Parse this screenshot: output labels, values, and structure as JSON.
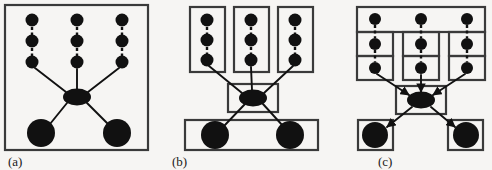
{
  "figure": {
    "background_color": "#f6f5f3",
    "ink_color": "#111111",
    "box_stroke_color": "#3a3a3a",
    "width": 492,
    "height": 170,
    "panel_count": 3
  },
  "panels": [
    {
      "id": "panel-a",
      "caption": "(a)",
      "caption_x": 8,
      "caption_y": 166,
      "description": "single enclosing box around the whole graph",
      "outer_boxes": [
        {
          "name": "panel-a-outer-box",
          "x": 5,
          "y": 5,
          "w": 143,
          "h": 145
        }
      ],
      "inner_boxes": [],
      "small_nodes": [
        {
          "name": "node-col1-row1",
          "cx": 32,
          "cy": 20,
          "r": 6.5
        },
        {
          "name": "node-col1-row2",
          "cx": 32,
          "cy": 41,
          "r": 6.5
        },
        {
          "name": "node-col1-row3",
          "cx": 32,
          "cy": 62,
          "r": 6.5
        },
        {
          "name": "node-col2-row1",
          "cx": 77,
          "cy": 20,
          "r": 6.5
        },
        {
          "name": "node-col2-row2",
          "cx": 77,
          "cy": 41,
          "r": 6.5
        },
        {
          "name": "node-col2-row3",
          "cx": 77,
          "cy": 62,
          "r": 6.5
        },
        {
          "name": "node-col3-row1",
          "cx": 122,
          "cy": 20,
          "r": 6.5
        },
        {
          "name": "node-col3-row2",
          "cx": 122,
          "cy": 41,
          "r": 6.5
        },
        {
          "name": "node-col3-row3",
          "cx": 122,
          "cy": 62,
          "r": 6.5
        }
      ],
      "hub_node": {
        "name": "hub-ellipse",
        "cx": 77,
        "cy": 97,
        "rx": 14,
        "ry": 8.5
      },
      "large_nodes": [
        {
          "name": "large-node-left",
          "cx": 41,
          "cy": 133,
          "r": 14
        },
        {
          "name": "large-node-right",
          "cx": 117,
          "cy": 133,
          "r": 14
        }
      ],
      "dashed_edges": [
        {
          "name": "dashed-edge-col1-12",
          "x1": 32,
          "y1": 27,
          "x2": 32,
          "y2": 35
        },
        {
          "name": "dashed-edge-col1-23",
          "x1": 32,
          "y1": 48,
          "x2": 32,
          "y2": 56
        },
        {
          "name": "dashed-edge-col2-12",
          "x1": 77,
          "y1": 27,
          "x2": 77,
          "y2": 35
        },
        {
          "name": "dashed-edge-col2-23",
          "x1": 77,
          "y1": 48,
          "x2": 77,
          "y2": 56
        },
        {
          "name": "dashed-edge-col3-12",
          "x1": 122,
          "y1": 27,
          "x2": 122,
          "y2": 35
        },
        {
          "name": "dashed-edge-col3-23",
          "x1": 122,
          "y1": 48,
          "x2": 122,
          "y2": 56
        }
      ],
      "solid_edges": [
        {
          "name": "edge-col1-to-hub",
          "x1": 35,
          "y1": 68,
          "x2": 66,
          "y2": 92
        },
        {
          "name": "edge-col2-to-hub",
          "x1": 77,
          "y1": 69,
          "x2": 77,
          "y2": 89
        },
        {
          "name": "edge-col3-to-hub",
          "x1": 119,
          "y1": 68,
          "x2": 88,
          "y2": 92
        },
        {
          "name": "edge-hub-to-left",
          "x1": 67,
          "y1": 103,
          "x2": 50,
          "y2": 124
        },
        {
          "name": "edge-hub-to-right",
          "x1": 87,
          "y1": 103,
          "x2": 108,
          "y2": 124
        }
      ],
      "arrowheads": false
    },
    {
      "id": "panel-b",
      "caption": "(b)",
      "caption_x": 172,
      "caption_y": 166,
      "description": "flat partition: one box per column, one box for hub, one box for both large nodes",
      "outer_boxes": [],
      "inner_boxes": [
        {
          "name": "cluster-box-col1",
          "x": 190,
          "y": 7,
          "w": 35,
          "h": 65
        },
        {
          "name": "cluster-box-col2",
          "x": 234,
          "y": 7,
          "w": 35,
          "h": 65
        },
        {
          "name": "cluster-box-col3",
          "x": 278,
          "y": 7,
          "w": 35,
          "h": 65
        },
        {
          "name": "cluster-box-hub",
          "x": 228,
          "y": 84,
          "w": 50,
          "h": 28
        },
        {
          "name": "cluster-box-sinks",
          "x": 185,
          "y": 120,
          "w": 133,
          "h": 30
        }
      ],
      "small_nodes": [
        {
          "name": "node-col1-row1",
          "cx": 207,
          "cy": 20,
          "r": 6.5
        },
        {
          "name": "node-col1-row2",
          "cx": 207,
          "cy": 40,
          "r": 6.5
        },
        {
          "name": "node-col1-row3",
          "cx": 207,
          "cy": 60,
          "r": 6.5
        },
        {
          "name": "node-col2-row1",
          "cx": 251,
          "cy": 20,
          "r": 6.5
        },
        {
          "name": "node-col2-row2",
          "cx": 251,
          "cy": 40,
          "r": 6.5
        },
        {
          "name": "node-col2-row3",
          "cx": 251,
          "cy": 60,
          "r": 6.5
        },
        {
          "name": "node-col3-row1",
          "cx": 295,
          "cy": 20,
          "r": 6.5
        },
        {
          "name": "node-col3-row2",
          "cx": 295,
          "cy": 40,
          "r": 6.5
        },
        {
          "name": "node-col3-row3",
          "cx": 295,
          "cy": 60,
          "r": 6.5
        }
      ],
      "hub_node": {
        "name": "hub-ellipse",
        "cx": 253,
        "cy": 98,
        "rx": 14,
        "ry": 8.5
      },
      "large_nodes": [
        {
          "name": "large-node-left",
          "cx": 215,
          "cy": 135,
          "r": 14
        },
        {
          "name": "large-node-right",
          "cx": 290,
          "cy": 135,
          "r": 14
        }
      ],
      "dashed_edges": [
        {
          "name": "dashed-edge-col1-12",
          "x1": 207,
          "y1": 27,
          "x2": 207,
          "y2": 34
        },
        {
          "name": "dashed-edge-col1-23",
          "x1": 207,
          "y1": 47,
          "x2": 207,
          "y2": 54
        },
        {
          "name": "dashed-edge-col2-12",
          "x1": 251,
          "y1": 27,
          "x2": 251,
          "y2": 34
        },
        {
          "name": "dashed-edge-col2-23",
          "x1": 251,
          "y1": 47,
          "x2": 251,
          "y2": 54
        },
        {
          "name": "dashed-edge-col3-12",
          "x1": 295,
          "y1": 27,
          "x2": 295,
          "y2": 34
        },
        {
          "name": "dashed-edge-col3-23",
          "x1": 295,
          "y1": 47,
          "x2": 295,
          "y2": 54
        }
      ],
      "solid_edges": [
        {
          "name": "edge-col1-to-hub",
          "x1": 209,
          "y1": 66,
          "x2": 242,
          "y2": 93
        },
        {
          "name": "edge-col2-to-hub",
          "x1": 251,
          "y1": 67,
          "x2": 252,
          "y2": 90
        },
        {
          "name": "edge-col3-to-hub",
          "x1": 293,
          "y1": 66,
          "x2": 264,
          "y2": 93
        },
        {
          "name": "edge-hub-to-left",
          "x1": 245,
          "y1": 104,
          "x2": 224,
          "y2": 126
        },
        {
          "name": "edge-hub-to-right",
          "x1": 263,
          "y1": 104,
          "x2": 283,
          "y2": 126
        }
      ],
      "arrowheads": false
    },
    {
      "id": "panel-c",
      "caption": "(c)",
      "caption_x": 378,
      "caption_y": 166,
      "description": "finer partition: top row shares one wide box, rows 2 and 3 boxed per column, hub boxed, each large node in its own box; edges carry arrowheads",
      "outer_boxes": [],
      "inner_boxes": [
        {
          "name": "cluster-box-top-row",
          "x": 357,
          "y": 7,
          "w": 128,
          "h": 25
        },
        {
          "name": "cluster-box-col1-row2",
          "x": 357,
          "y": 32,
          "w": 36,
          "h": 24
        },
        {
          "name": "cluster-box-col1-row3",
          "x": 357,
          "y": 56,
          "w": 36,
          "h": 24
        },
        {
          "name": "cluster-box-col2-row2",
          "x": 403,
          "y": 32,
          "w": 36,
          "h": 24
        },
        {
          "name": "cluster-box-col2-row3",
          "x": 403,
          "y": 56,
          "w": 36,
          "h": 24
        },
        {
          "name": "cluster-box-col3-row2",
          "x": 449,
          "y": 32,
          "w": 36,
          "h": 24
        },
        {
          "name": "cluster-box-col3-row3",
          "x": 449,
          "y": 56,
          "w": 36,
          "h": 24
        },
        {
          "name": "cluster-box-hub",
          "x": 396,
          "y": 86,
          "w": 50,
          "h": 28
        },
        {
          "name": "cluster-box-sink-left",
          "x": 358,
          "y": 120,
          "w": 35,
          "h": 30
        },
        {
          "name": "cluster-box-sink-right",
          "x": 448,
          "y": 120,
          "w": 35,
          "h": 30
        }
      ],
      "small_nodes": [
        {
          "name": "node-col1-row1",
          "cx": 375,
          "cy": 19,
          "r": 6
        },
        {
          "name": "node-col1-row2",
          "cx": 375,
          "cy": 44,
          "r": 6
        },
        {
          "name": "node-col1-row3",
          "cx": 375,
          "cy": 68,
          "r": 6
        },
        {
          "name": "node-col2-row1",
          "cx": 421,
          "cy": 19,
          "r": 6
        },
        {
          "name": "node-col2-row2",
          "cx": 421,
          "cy": 44,
          "r": 6
        },
        {
          "name": "node-col2-row3",
          "cx": 421,
          "cy": 68,
          "r": 6
        },
        {
          "name": "node-col3-row1",
          "cx": 467,
          "cy": 19,
          "r": 6
        },
        {
          "name": "node-col3-row2",
          "cx": 467,
          "cy": 44,
          "r": 6
        },
        {
          "name": "node-col3-row3",
          "cx": 467,
          "cy": 68,
          "r": 6
        }
      ],
      "hub_node": {
        "name": "hub-ellipse",
        "cx": 421,
        "cy": 100,
        "rx": 14,
        "ry": 8.5
      },
      "large_nodes": [
        {
          "name": "large-node-left",
          "cx": 375,
          "cy": 135,
          "r": 13
        },
        {
          "name": "large-node-right",
          "cx": 466,
          "cy": 135,
          "r": 13
        }
      ],
      "dashed_edges": [
        {
          "name": "dashed-edge-col1-12",
          "x1": 375,
          "y1": 25,
          "x2": 375,
          "y2": 38
        },
        {
          "name": "dashed-edge-col1-23",
          "x1": 375,
          "y1": 50,
          "x2": 375,
          "y2": 62
        },
        {
          "name": "dashed-edge-col2-12",
          "x1": 421,
          "y1": 25,
          "x2": 421,
          "y2": 38
        },
        {
          "name": "dashed-edge-col2-23",
          "x1": 421,
          "y1": 50,
          "x2": 421,
          "y2": 62
        },
        {
          "name": "dashed-edge-col3-12",
          "x1": 467,
          "y1": 25,
          "x2": 467,
          "y2": 38
        },
        {
          "name": "dashed-edge-col3-23",
          "x1": 467,
          "y1": 50,
          "x2": 467,
          "y2": 62
        }
      ],
      "solid_edges": [
        {
          "name": "edge-col1-to-hub",
          "x1": 377,
          "y1": 74,
          "x2": 409,
          "y2": 95
        },
        {
          "name": "edge-col2-to-hub",
          "x1": 421,
          "y1": 75,
          "x2": 421,
          "y2": 92
        },
        {
          "name": "edge-col3-to-hub",
          "x1": 465,
          "y1": 74,
          "x2": 433,
          "y2": 95
        },
        {
          "name": "edge-hub-to-left",
          "x1": 412,
          "y1": 107,
          "x2": 387,
          "y2": 127
        },
        {
          "name": "edge-hub-to-right",
          "x1": 431,
          "y1": 107,
          "x2": 455,
          "y2": 127
        }
      ],
      "arrowheads": true
    }
  ]
}
